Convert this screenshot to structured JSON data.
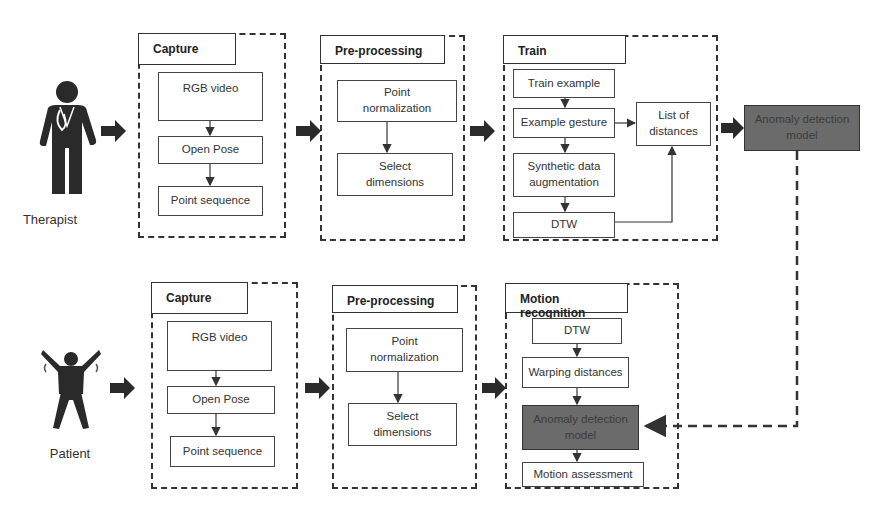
{
  "top_row": {
    "actor": {
      "label": "Therapist",
      "icon": "doctor-icon"
    },
    "capture": {
      "title": "Capture",
      "steps": [
        "RGB video",
        "Open Pose",
        "Point sequence"
      ]
    },
    "preprocessing": {
      "title": "Pre-processing",
      "steps": [
        "Point\nnormalization",
        "Select\ndimensions"
      ]
    },
    "train": {
      "title": "Train",
      "steps": [
        "Train example",
        "Example gesture",
        "Synthetic data\naugmentation",
        "DTW"
      ],
      "side_output": "List of\ndistances"
    },
    "output": "Anomaly detection\nmodel"
  },
  "bottom_row": {
    "actor": {
      "label": "Patient",
      "icon": "patient-exercising-icon"
    },
    "capture": {
      "title": "Capture",
      "steps": [
        "RGB video",
        "Open Pose",
        "Point sequence"
      ]
    },
    "preprocessing": {
      "title": "Pre-processing",
      "steps": [
        "Point\nnormalization",
        "Select\ndimensions"
      ]
    },
    "motion_recognition": {
      "title": "Motion recognition",
      "steps": [
        "DTW",
        "Warping distances",
        "Anomaly detection\nmodel",
        "Motion assessment"
      ]
    }
  },
  "colors": {
    "stroke": "#333333",
    "model_fill": "#6b6b6b",
    "background": "#ffffff"
  }
}
